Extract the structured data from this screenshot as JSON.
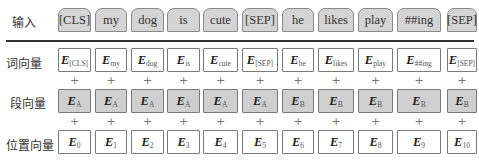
{
  "rows": {
    "input_label": "输入",
    "token_label": "词向量",
    "segment_label": "段向量",
    "position_label": "位置向量"
  },
  "tokens": [
    "[CLS]",
    "my",
    "dog",
    "is",
    "cute",
    "[SEP]",
    "he",
    "likes",
    "play",
    "##ing",
    "[SEP]"
  ],
  "token_embeddings": [
    {
      "base": "E",
      "sub": "[CLS]"
    },
    {
      "base": "E",
      "sub": "my"
    },
    {
      "base": "E",
      "sub": "dog"
    },
    {
      "base": "E",
      "sub": "is"
    },
    {
      "base": "E",
      "sub": "cute"
    },
    {
      "base": "E",
      "sub": "[SEP]"
    },
    {
      "base": "E",
      "sub": "he"
    },
    {
      "base": "E",
      "sub": "likes"
    },
    {
      "base": "E",
      "sub": "play"
    },
    {
      "base": "E",
      "sub": "##ing"
    },
    {
      "base": "E",
      "sub": "[SEP]"
    }
  ],
  "segment_embeddings": [
    {
      "base": "E",
      "sub": "A"
    },
    {
      "base": "E",
      "sub": "A"
    },
    {
      "base": "E",
      "sub": "A"
    },
    {
      "base": "E",
      "sub": "A"
    },
    {
      "base": "E",
      "sub": "A"
    },
    {
      "base": "E",
      "sub": "A"
    },
    {
      "base": "E",
      "sub": "B"
    },
    {
      "base": "E",
      "sub": "B"
    },
    {
      "base": "E",
      "sub": "B"
    },
    {
      "base": "E",
      "sub": "B"
    },
    {
      "base": "E",
      "sub": "B"
    }
  ],
  "position_embeddings": [
    {
      "base": "E",
      "sub": "0"
    },
    {
      "base": "E",
      "sub": "1"
    },
    {
      "base": "E",
      "sub": "2"
    },
    {
      "base": "E",
      "sub": "3"
    },
    {
      "base": "E",
      "sub": "4"
    },
    {
      "base": "E",
      "sub": "5"
    },
    {
      "base": "E",
      "sub": "6"
    },
    {
      "base": "E",
      "sub": "7"
    },
    {
      "base": "E",
      "sub": "8"
    },
    {
      "base": "E",
      "sub": "9"
    },
    {
      "base": "E",
      "sub": "10"
    }
  ],
  "plus_symbol": "+",
  "colors": {
    "token_fill": "#d4d4d4",
    "segment_fill": "#cfcfcf",
    "embedding_fill": "#ffffff",
    "border": "#7a7a7a",
    "rule": "#333333"
  }
}
